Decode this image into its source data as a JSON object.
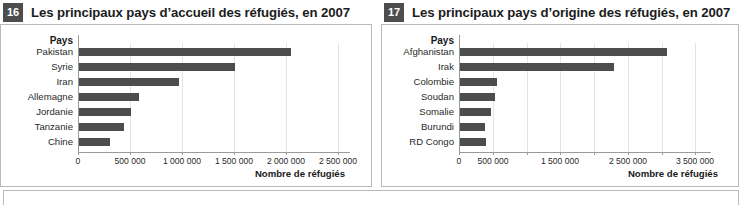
{
  "figures": [
    {
      "badge": "16",
      "title": "Les principaux pays d’accueil des réfugiés, en 2007",
      "category_header": "Pays",
      "axis_title": "Nombre de réfugiés",
      "chart_data": {
        "type": "bar",
        "orientation": "horizontal",
        "title": "Les principaux pays d’accueil des réfugiés, en 2007",
        "categories": [
          "Pakistan",
          "Syrie",
          "Iran",
          "Allemagne",
          "Jordanie",
          "Tanzanie",
          "Chine"
        ],
        "values": [
          2040000,
          1500000,
          965000,
          580000,
          500000,
          435000,
          300000
        ],
        "xlabel": "Nombre de réfugiés",
        "ylabel": "Pays",
        "xlim": [
          0,
          2600000
        ],
        "xticks": [
          0,
          500000,
          1000000,
          1500000,
          2000000,
          2500000
        ],
        "xticklabels": [
          "0",
          "500 000",
          "1 000 000",
          "1 500 000",
          "2 000 000",
          "2 500 000"
        ],
        "grid": true,
        "legend": false,
        "bar_color": "#4d4d4d"
      }
    },
    {
      "badge": "17",
      "title": "Les principaux pays d’origine des réfugiés, en 2007",
      "category_header": "Pays",
      "axis_title": "Nombre de réfugiés",
      "chart_data": {
        "type": "bar",
        "orientation": "horizontal",
        "title": "Les principaux pays d’origine des réfugiés, en 2007",
        "categories": [
          "Afghanistan",
          "Irak",
          "Colombie",
          "Soudan",
          "Somalie",
          "Burundi",
          "RD Congo"
        ],
        "values": [
          3060000,
          2280000,
          550000,
          520000,
          455000,
          375000,
          390000
        ],
        "xlabel": "Nombre de réfugiés",
        "ylabel": "Pays",
        "xlim": [
          0,
          3700000
        ],
        "xticks": [
          0,
          500000,
          1000000,
          1500000,
          2000000,
          2500000,
          3000000,
          3500000
        ],
        "xticklabels": [
          "0",
          "500 000",
          "",
          "1 500 000",
          "",
          "2 500 000",
          "",
          "3 500 000"
        ],
        "grid": true,
        "legend": false,
        "bar_color": "#4d4d4d"
      }
    }
  ],
  "colors": {
    "bar": "#4d4d4d",
    "badge_bg": "#4d4d4d",
    "badge_text": "#ffffff",
    "frame": "#b9b9b9",
    "axis": "#9a9a9a",
    "grid": "#e4e4e4"
  }
}
